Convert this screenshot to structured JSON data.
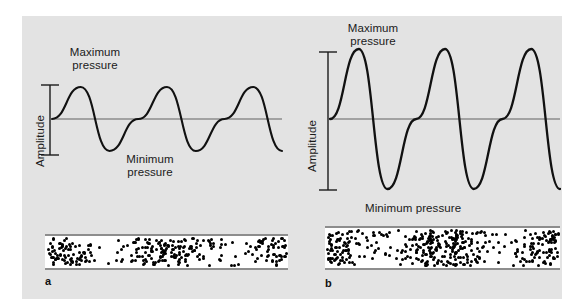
{
  "figure": {
    "background_color": "#e3e3e3",
    "page_color": "#ffffff",
    "wave_color": "#111111",
    "axis_color": "#8d8d8d",
    "dot_color": "#000000"
  },
  "panel_a": {
    "letter": "a",
    "max_label": "Maximum\npressure",
    "min_label": "Minimum\npressure",
    "amplitude_label": "Amplitude"
  },
  "panel_b": {
    "letter": "b",
    "max_label": "Maximum\npressure",
    "min_label": "Minimum pressure",
    "amplitude_label": "Amplitude"
  },
  "chart_data": {
    "type": "line",
    "xlabel": "",
    "ylabel": "Pressure",
    "grid": false,
    "legend": false,
    "series": [
      {
        "name": "panel a wave (small amplitude)",
        "waveform": "sine",
        "baseline_y": 119,
        "amplitude_px": 32,
        "peak_y": 87,
        "trough_y": 152,
        "cycles": 2,
        "x_start": 52,
        "x_end": 282,
        "annotations": [
          "Maximum pressure",
          "Minimum pressure",
          "Amplitude"
        ]
      },
      {
        "name": "panel b wave (large amplitude)",
        "waveform": "sine",
        "baseline_y": 119,
        "amplitude_px": 70,
        "peak_y": 49,
        "trough_y": 189,
        "cycles": 2,
        "x_start": 330,
        "x_end": 560,
        "annotations": [
          "Maximum pressure",
          "Minimum pressure",
          "Amplitude"
        ]
      }
    ],
    "density_strips": [
      {
        "name": "panel a particle density",
        "compressions": 2,
        "density": "moderate",
        "x_start": 45,
        "x_end": 288,
        "y_top": 236,
        "y_bottom": 268
      },
      {
        "name": "panel b particle density",
        "compressions": 2,
        "density": "high",
        "x_start": 325,
        "x_end": 560,
        "y_top": 228,
        "y_bottom": 268
      }
    ]
  }
}
